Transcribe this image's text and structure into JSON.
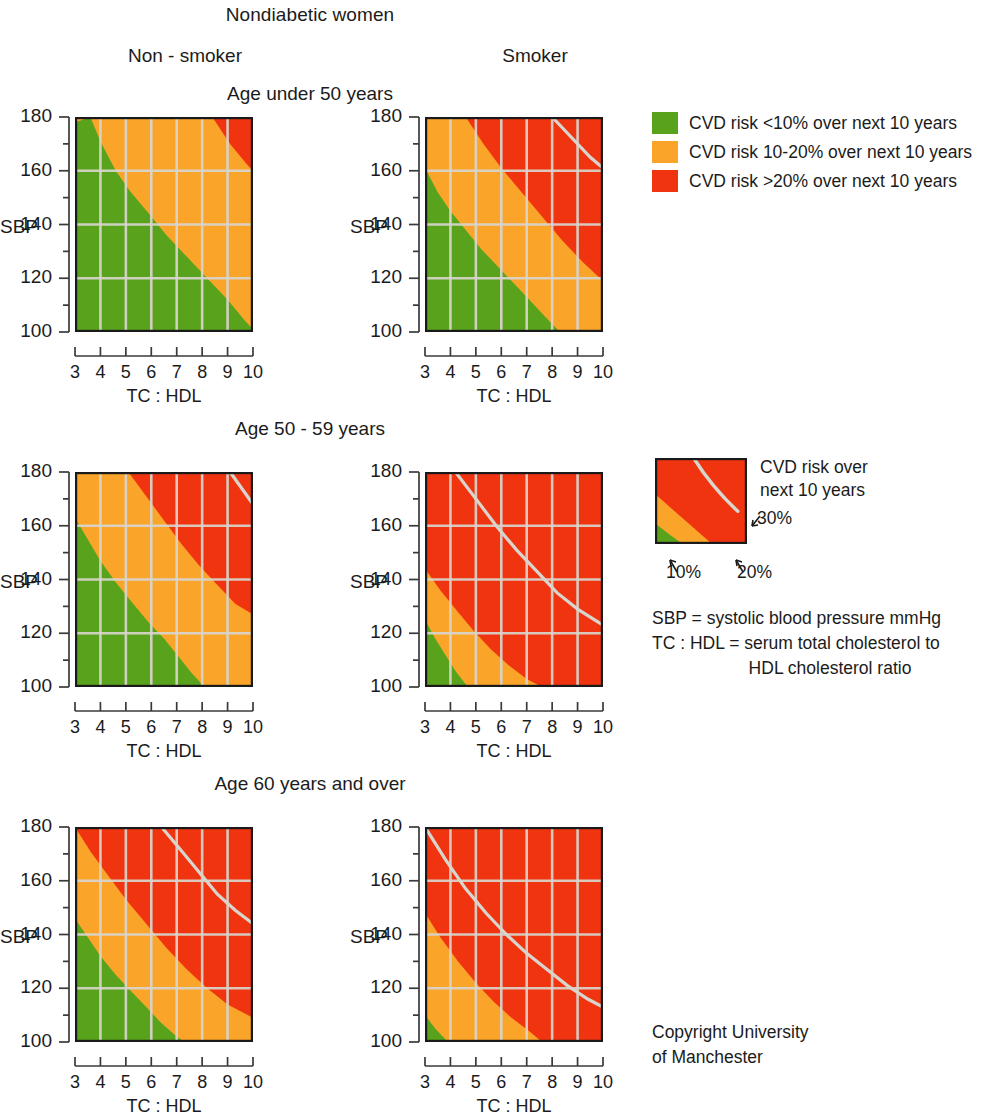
{
  "title": "Nondiabetic women",
  "columns": [
    {
      "key": "nonsmoker",
      "label": "Non - smoker"
    },
    {
      "key": "smoker",
      "label": "Smoker"
    }
  ],
  "rows": [
    {
      "key": "under50",
      "label": "Age under 50 years"
    },
    {
      "key": "age50_59",
      "label": "Age 50 - 59 years"
    },
    {
      "key": "age60plus",
      "label": "Age 60 years and over"
    }
  ],
  "axes": {
    "y_title": "SBP",
    "y_ticks": [
      "180",
      "160",
      "140",
      "120",
      "100"
    ],
    "y_min": 100,
    "y_max": 180,
    "x_title": "TC : HDL",
    "x_ticks": [
      "3",
      "4",
      "5",
      "6",
      "7",
      "8",
      "9",
      "10"
    ],
    "x_min": 3,
    "x_max": 10
  },
  "colors": {
    "low": "#59a31c",
    "moderate": "#fba42a",
    "high": "#f0340f",
    "grid": "#d9d5cd",
    "frame": "#1a1a1a",
    "text": "#1b1b1b"
  },
  "legend": {
    "items": [
      {
        "color_key": "low",
        "label": "CVD risk <10% over next 10 years"
      },
      {
        "color_key": "moderate",
        "label": "CVD risk 10-20% over next 10 years"
      },
      {
        "color_key": "high",
        "label": "CVD risk >20% over next 10 years"
      }
    ]
  },
  "key": {
    "caption_line1": "CVD risk over",
    "caption_line2": "next 10 years",
    "label_30": "30%",
    "label_10": "10%",
    "label_20": "20%"
  },
  "notes": {
    "line1": "SBP = systolic blood pressure mmHg",
    "line2": "TC : HDL = serum total cholesterol to",
    "line3": "HDL cholesterol ratio"
  },
  "copyright": {
    "line1": "Copyright University",
    "line2": "of Manchester"
  },
  "chart_data": {
    "type": "heatmap",
    "title": "Nondiabetic women",
    "xlabel": "TC : HDL",
    "ylabel": "SBP",
    "xlim": [
      3,
      10
    ],
    "ylim": [
      100,
      180
    ],
    "grid": true,
    "legend_position": "right",
    "bands": [
      {
        "name": "CVD risk <10% over next 10 years",
        "color": "#59a31c"
      },
      {
        "name": "CVD risk 10-20% over next 10 years",
        "color": "#fba42a"
      },
      {
        "name": "CVD risk >20% over next 10 years",
        "color": "#f0340f"
      }
    ],
    "panels": [
      {
        "row": "Age under 50 years",
        "column": "Non - smoker",
        "boundaries": {
          "10pct": [
            [
              3,
              178
            ],
            [
              3.6,
              180
            ],
            [
              4,
              171
            ],
            [
              4.6,
              160
            ],
            [
              5.2,
              152
            ],
            [
              6,
              143
            ],
            [
              6.6,
              136
            ],
            [
              7.4,
              128
            ],
            [
              8.2,
              120
            ],
            [
              9,
              112
            ],
            [
              9.7,
              104
            ],
            [
              10,
              101
            ]
          ],
          "20pct": [
            [
              8.4,
              180
            ],
            [
              9.1,
              170
            ],
            [
              9.8,
              162
            ],
            [
              10,
              160
            ]
          ],
          "30pct": []
        }
      },
      {
        "row": "Age under 50 years",
        "column": "Smoker",
        "boundaries": {
          "10pct": [
            [
              3,
              161
            ],
            [
              3.5,
              152
            ],
            [
              4,
              145
            ],
            [
              4.6,
              138
            ],
            [
              5.2,
              131
            ],
            [
              5.9,
              124
            ],
            [
              6.5,
              118
            ],
            [
              7.1,
              112
            ],
            [
              7.7,
              106
            ],
            [
              8.3,
              100
            ]
          ],
          "20pct": [
            [
              4.6,
              180
            ],
            [
              5.3,
              170
            ],
            [
              6,
              161
            ],
            [
              6.8,
              152
            ],
            [
              7.6,
              143
            ],
            [
              8.4,
              134
            ],
            [
              9.2,
              126
            ],
            [
              10,
              119
            ]
          ],
          "30pct": [
            [
              8,
              180
            ],
            [
              8.8,
              172
            ],
            [
              9.5,
              165
            ],
            [
              10,
              161
            ]
          ]
        }
      },
      {
        "row": "Age 50 - 59 years",
        "column": "Non - smoker",
        "boundaries": {
          "10pct": [
            [
              3,
              163
            ],
            [
              3.5,
              155
            ],
            [
              4,
              147
            ],
            [
              4.6,
              139
            ],
            [
              5.2,
              132
            ],
            [
              5.9,
              124
            ],
            [
              6.5,
              118
            ],
            [
              7.1,
              111
            ],
            [
              7.6,
              105
            ],
            [
              8.1,
              100
            ]
          ],
          "20pct": [
            [
              5.1,
              180
            ],
            [
              5.8,
              171
            ],
            [
              6.5,
              162
            ],
            [
              7.2,
              153
            ],
            [
              7.9,
              145
            ],
            [
              8.6,
              138
            ],
            [
              9.3,
              131
            ],
            [
              10,
              127
            ]
          ],
          "30pct": [
            [
              9.1,
              180
            ],
            [
              9.7,
              172
            ],
            [
              10,
              168
            ]
          ]
        }
      },
      {
        "row": "Age 50 - 59 years",
        "column": "Smoker",
        "boundaries": {
          "10pct": [
            [
              3,
              125
            ],
            [
              3.4,
              118
            ],
            [
              3.8,
              112
            ],
            [
              4.2,
              106
            ],
            [
              4.6,
              101
            ],
            [
              4.8,
              100
            ]
          ],
          "20pct": [
            [
              3,
              144
            ],
            [
              3.6,
              136
            ],
            [
              4.2,
              129
            ],
            [
              4.9,
              121
            ],
            [
              5.6,
              114
            ],
            [
              6.3,
              108
            ],
            [
              7,
              103
            ],
            [
              7.6,
              100
            ]
          ],
          "30pct": [
            [
              4.2,
              180
            ],
            [
              5,
              170
            ],
            [
              5.8,
              160
            ],
            [
              6.6,
              151
            ],
            [
              7.4,
              143
            ],
            [
              8.2,
              135
            ],
            [
              9,
              129
            ],
            [
              10,
              123
            ]
          ]
        }
      },
      {
        "row": "Age 60 years and over",
        "column": "Non - smoker",
        "boundaries": {
          "10pct": [
            [
              3,
              146
            ],
            [
              3.5,
              139
            ],
            [
              4,
              132
            ],
            [
              4.6,
              125
            ],
            [
              5.2,
              119
            ],
            [
              5.8,
              113
            ],
            [
              6.4,
              107
            ],
            [
              7,
              102
            ],
            [
              7.3,
              100
            ]
          ],
          "20pct": [
            [
              3,
              180
            ],
            [
              3.6,
              171
            ],
            [
              4.3,
              162
            ],
            [
              5,
              153
            ],
            [
              5.8,
              144
            ],
            [
              6.6,
              135
            ],
            [
              7.4,
              127
            ],
            [
              8.2,
              120
            ],
            [
              9,
              114
            ],
            [
              10,
              109
            ]
          ],
          "30pct": [
            [
              6.4,
              180
            ],
            [
              7.2,
              171
            ],
            [
              7.9,
              163
            ],
            [
              8.6,
              155
            ],
            [
              9.3,
              149
            ],
            [
              10,
              144
            ]
          ]
        }
      },
      {
        "row": "Age 60 years and over",
        "column": "Smoker",
        "boundaries": {
          "10pct": [
            [
              3,
              110
            ],
            [
              3.4,
              105
            ],
            [
              3.8,
              101
            ],
            [
              4,
              100
            ]
          ],
          "20pct": [
            [
              3,
              148
            ],
            [
              3.6,
              139
            ],
            [
              4.3,
              130
            ],
            [
              5,
              122
            ],
            [
              5.7,
              115
            ],
            [
              6.4,
              109
            ],
            [
              7.1,
              104
            ],
            [
              7.6,
              100
            ]
          ],
          "30pct": [
            [
              3,
              180
            ],
            [
              3.8,
              168
            ],
            [
              4.6,
              157
            ],
            [
              5.4,
              148
            ],
            [
              6.2,
              140
            ],
            [
              7,
              133
            ],
            [
              7.8,
              127
            ],
            [
              8.6,
              121
            ],
            [
              9.4,
              116
            ],
            [
              10,
              113
            ]
          ]
        }
      }
    ]
  }
}
